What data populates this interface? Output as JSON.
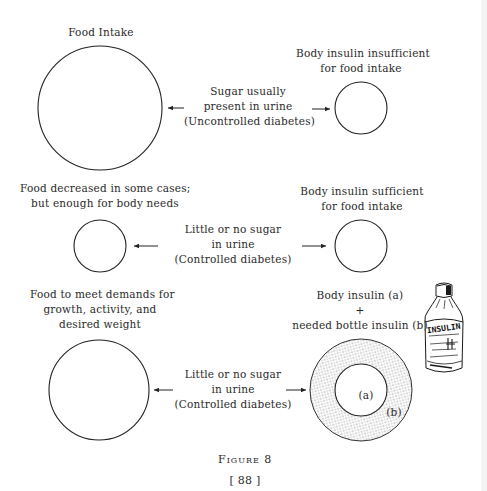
{
  "figure": {
    "caption": "Figure 8",
    "page_number": "[ 88 ]"
  },
  "rows": [
    {
      "left_label": [
        "Food Intake"
      ],
      "center_label": [
        "Sugar usually",
        "present in urine",
        "(Uncontrolled diabetes)"
      ],
      "right_label": [
        "Body insulin insufficient",
        "for food intake"
      ]
    },
    {
      "left_label": [
        "Food decreased in some cases;",
        "but enough for body needs"
      ],
      "center_label": [
        "Little or no sugar",
        "in urine",
        "(Controlled diabetes)"
      ],
      "right_label": [
        "Body insulin sufficient",
        "for food intake"
      ]
    },
    {
      "left_label": [
        "Food to meet demands for",
        "growth, activity, and",
        "desired weight"
      ],
      "center_label": [
        "Little or no sugar",
        "in urine",
        "(Controlled diabetes)"
      ],
      "right_label": [
        "Body insulin (a)",
        "+",
        "needed bottle insulin (b)"
      ],
      "inner_label": "(a)",
      "outer_label": "(b)"
    }
  ],
  "bottle": {
    "label": "INSULIN"
  }
}
